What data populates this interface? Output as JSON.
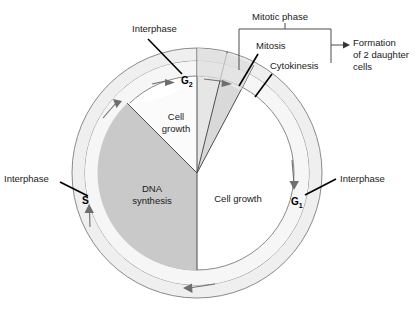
{
  "figure": {
    "center": {
      "x": 197,
      "y": 173
    },
    "radii": {
      "outer": 125,
      "mid": 112,
      "inner": 97
    }
  },
  "colors": {
    "background": "#ffffff",
    "ring_band": "#eeeeee",
    "inner_light": "#fafafa",
    "sector_dna": "#c9c9c9",
    "sector_mitosis": "#dcdcdc",
    "sector_cytokinesis": "#e6e6e6",
    "stroke_ring": "#8a8a8a",
    "stroke_sector": "#4d4d4d",
    "text": "#1a1a1a"
  },
  "inner_sectors": [
    {
      "name": "g2-cell-growth",
      "label_line1": "Cell",
      "label_line2": "growth",
      "start_deg": 90,
      "end_deg": 136,
      "fill": "#fbfbfb"
    },
    {
      "name": "s-dna-synthesis",
      "label_line1": "DNA",
      "label_line2": "synthesis",
      "start_deg": 136,
      "end_deg": 270,
      "fill": "#c9c9c9"
    },
    {
      "name": "g1-cell-growth",
      "label_line1": "Cell growth",
      "label_line2": "",
      "start_deg": 270,
      "end_deg": 423,
      "fill": "#fbfbfb"
    },
    {
      "name": "mitosis-wedge",
      "label_line1": "",
      "label_line2": "",
      "start_deg": 63,
      "end_deg": 76,
      "fill": "#dcdcdc"
    },
    {
      "name": "cytokinesis-wedge",
      "label_line1": "",
      "label_line2": "",
      "start_deg": 76,
      "end_deg": 90,
      "fill": "#e4e4e4"
    }
  ],
  "phase_markers": [
    {
      "name": "g2-marker",
      "letter": "G",
      "subscript": "2",
      "x": 186,
      "y": 80
    },
    {
      "name": "s-marker",
      "letter": "S",
      "subscript": "",
      "x": 85,
      "y": 200
    },
    {
      "name": "g1-marker",
      "letter": "G",
      "subscript": "1",
      "x": 296,
      "y": 201
    }
  ],
  "annotations": {
    "interphase_top": {
      "label": "Interphase",
      "x": 132,
      "y": 32
    },
    "interphase_left": {
      "label": "Interphase",
      "x": 4,
      "y": 182
    },
    "interphase_right": {
      "label": "Interphase",
      "x": 340,
      "y": 182
    },
    "mitotic_phase": {
      "label": "Mitotic phase",
      "x": 252,
      "y": 20
    },
    "mitosis": {
      "label": "Mitosis",
      "x": 256,
      "y": 49
    },
    "cytokinesis": {
      "label": "Cytokinesis",
      "x": 270,
      "y": 69
    },
    "formation": {
      "line1": "Formation",
      "line2": "of 2 daughter",
      "line3": "cells",
      "x": 350,
      "y": 43
    }
  },
  "ring_arrows": [
    {
      "name": "ring-arrow-top-left",
      "note": "outer band arrow pointing clockwise near G2"
    },
    {
      "name": "ring-arrow-top-right",
      "note": "outer band arrow past G2 toward mitosis"
    },
    {
      "name": "ring-arrow-mid-upper-left",
      "note": "middle ring arrow pointing up-right"
    },
    {
      "name": "ring-arrow-left-s",
      "note": "middle ring arrow pointing up near S"
    },
    {
      "name": "ring-arrow-right-g1",
      "note": "middle ring arrow pointing down near G1"
    },
    {
      "name": "ring-arrow-bottom",
      "note": "middle ring arrow pointing left at bottom"
    }
  ]
}
